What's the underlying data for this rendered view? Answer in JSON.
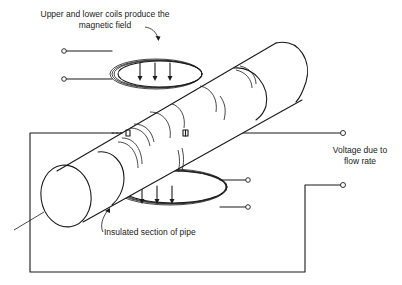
{
  "figure": {
    "type": "schematic",
    "labels": {
      "coils": "Upper and lower coils produce the magnetic field",
      "coils_line1": "Upper and lower coils produce the",
      "coils_line2": "magnetic field",
      "voltage_line1": "Voltage due to",
      "voltage_line2": "flow rate",
      "insulated": "Insulated section of pipe"
    },
    "components": [
      {
        "name": "upper-coil",
        "field_arrows": 3,
        "terminals": 2
      },
      {
        "name": "lower-coil",
        "field_arrows": 3,
        "terminals": 2
      },
      {
        "name": "pipe",
        "segments": [
          "inlet section",
          "insulated section",
          "outlet section"
        ]
      },
      {
        "name": "electrodes",
        "count": 2
      },
      {
        "name": "voltage-output",
        "terminals": 2
      }
    ]
  }
}
